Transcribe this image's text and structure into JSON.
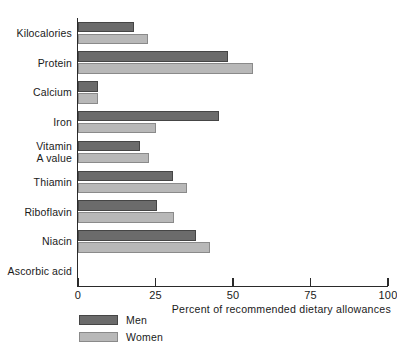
{
  "chart_data": {
    "type": "bar",
    "orientation": "horizontal",
    "title": "",
    "xlabel": "Percent of recommended dietary allowances",
    "ylabel": "",
    "xlim": [
      0,
      100
    ],
    "xticks": [
      0,
      25,
      50,
      75,
      100
    ],
    "xtick_labels": [
      "0",
      "25",
      "50",
      "75",
      "100"
    ],
    "grid": false,
    "legend_position": "bottom-left",
    "categories": [
      "Kilocalories",
      "Protein",
      "Calcium",
      "Iron",
      "Vitamin\nA value",
      "Thiamin",
      "Riboflavin",
      "Niacin",
      "Ascorbic acid"
    ],
    "series": [
      {
        "name": "Men",
        "color": "#6b6b6b",
        "values": [
          18,
          48.5,
          6.5,
          45.5,
          20,
          30.5,
          25.5,
          38,
          0
        ]
      },
      {
        "name": "Women",
        "color": "#b8b8b8",
        "values": [
          22.5,
          56.5,
          6.5,
          25,
          23,
          35,
          31,
          42.5,
          0
        ]
      }
    ]
  },
  "legend": {
    "entries": [
      {
        "label": "Men",
        "swatch": "men"
      },
      {
        "label": "Women",
        "swatch": "women"
      }
    ]
  }
}
